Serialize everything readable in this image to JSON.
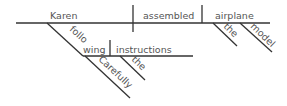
{
  "diagram": {
    "type": "Reed-Kellogg sentence diagram",
    "colors": {
      "line": "#333333",
      "text": "#555555",
      "background": "#ffffff"
    },
    "words": {
      "subject": "Karen",
      "verb": "assembled",
      "object": "airplane",
      "object_modifier_1": "the",
      "object_modifier_2": "model",
      "participle": "following",
      "participle_object": "instructions",
      "participle_object_modifier": "the",
      "participle_adverb": "Carefully"
    }
  }
}
